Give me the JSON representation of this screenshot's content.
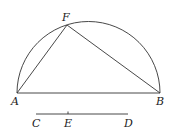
{
  "diagram": {
    "points": {
      "A": {
        "label": "A",
        "x": 17,
        "y": 93
      },
      "B": {
        "label": "B",
        "x": 160,
        "y": 93
      },
      "F": {
        "label": "F",
        "x": 67,
        "y": 25
      },
      "C": {
        "label": "C",
        "x": 36,
        "y": 114
      },
      "E": {
        "label": "E",
        "x": 68,
        "y": 114
      },
      "D": {
        "label": "D",
        "x": 128,
        "y": 114
      }
    },
    "labels": {
      "A": "A",
      "B": "B",
      "F": "F",
      "C": "C",
      "E": "E",
      "D": "D"
    },
    "stroke_color": "#333333"
  }
}
